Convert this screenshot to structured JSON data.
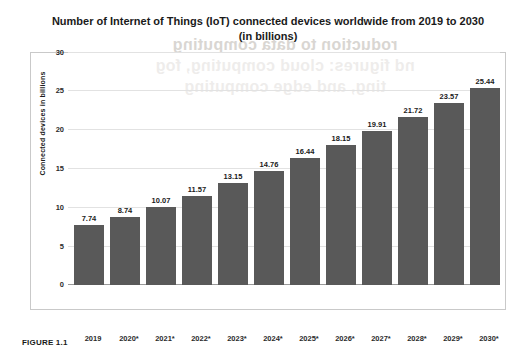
{
  "ghost_text": "roduction to data computing\nnd figures: cloud computing, fog\nting, and edge computing",
  "caption": "FIGURE 1.1",
  "chart_data": {
    "type": "bar",
    "title": "Number of Internet of Things (IoT) connected devices worldwide from 2019 to 2030 (in billions)",
    "xlabel": "",
    "ylabel": "Connected devices in billions",
    "categories": [
      "2019",
      "2020*",
      "2021*",
      "2022*",
      "2023*",
      "2024*",
      "2025*",
      "2026*",
      "2027*",
      "2028*",
      "2029*",
      "2030*"
    ],
    "values": [
      7.74,
      8.74,
      10.07,
      11.57,
      13.15,
      14.76,
      16.44,
      18.15,
      19.91,
      21.72,
      23.57,
      25.44
    ],
    "value_labels": [
      "7.74",
      "8.74",
      "10.07",
      "11.57",
      "13.15",
      "14.76",
      "16.44",
      "18.15",
      "19.91",
      "21.72",
      "23.57",
      "25.44"
    ],
    "yticks": [
      "0",
      "5",
      "10",
      "15",
      "20",
      "25",
      "30"
    ],
    "ylim": [
      0,
      30
    ],
    "grid": true,
    "legend": "none",
    "bar_color": "#595959"
  }
}
